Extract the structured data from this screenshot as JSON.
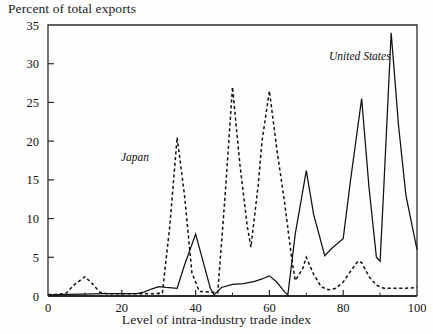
{
  "chart_data": {
    "type": "line",
    "title": "",
    "ylabel": "Percent of total exports",
    "xlabel": "Level of intra-industry trade index",
    "xlim": [
      0,
      100
    ],
    "ylim": [
      0,
      35
    ],
    "xticks": [
      0,
      20,
      40,
      60,
      80,
      100
    ],
    "xticks_minor": [
      10,
      30,
      50,
      70,
      90
    ],
    "yticks": [
      0,
      5,
      10,
      15,
      20,
      25,
      30,
      35
    ],
    "grid": false,
    "legend_position": "inline-annotations",
    "annotations": [
      {
        "text": "Japan",
        "x": 33,
        "y": 17.0,
        "style": "italic"
      },
      {
        "text": "United States",
        "x": 84,
        "y": 29.5,
        "style": "italic"
      }
    ],
    "series": [
      {
        "name": "Japan",
        "style": "dashed",
        "color": "#111111",
        "x": [
          0,
          3,
          5,
          7,
          10,
          12,
          14,
          16,
          20,
          24,
          27,
          29,
          31,
          33,
          35,
          37,
          39,
          41,
          44,
          46,
          48,
          50,
          52,
          54,
          55,
          57,
          58,
          60,
          62,
          64,
          66,
          67,
          69,
          70,
          72,
          74,
          76,
          78,
          80,
          82,
          84,
          85,
          87,
          89,
          91,
          93,
          95,
          97,
          100
        ],
        "y": [
          0.2,
          0.2,
          0.4,
          1.4,
          2.5,
          1.6,
          0.5,
          0.3,
          0.3,
          0.3,
          0.3,
          0.3,
          0.4,
          9.0,
          20.5,
          13.0,
          3.0,
          0.6,
          0.5,
          0.4,
          13.0,
          27.0,
          17.0,
          9.0,
          6.3,
          14.5,
          20.0,
          26.5,
          19.0,
          12.5,
          5.0,
          2.0,
          3.5,
          5.0,
          2.8,
          1.2,
          0.8,
          1.0,
          1.8,
          3.2,
          4.5,
          4.3,
          2.5,
          1.4,
          1.0,
          1.0,
          1.0,
          1.0,
          1.1
        ]
      },
      {
        "name": "United States",
        "style": "solid",
        "color": "#111111",
        "x": [
          0,
          5,
          10,
          15,
          20,
          24,
          26,
          28,
          30,
          32,
          35,
          37,
          40,
          42,
          44,
          45,
          47,
          50,
          53,
          56,
          58,
          60,
          62,
          64,
          65,
          67,
          70,
          72,
          75,
          77,
          80,
          82,
          85,
          87,
          89,
          90,
          91,
          93,
          95,
          97,
          100
        ],
        "y": [
          0.15,
          0.2,
          0.25,
          0.3,
          0.3,
          0.3,
          0.5,
          0.9,
          1.2,
          1.1,
          1.0,
          4.0,
          8.0,
          4.5,
          1.0,
          0.15,
          1.1,
          1.5,
          1.6,
          1.9,
          2.2,
          2.6,
          1.8,
          0.6,
          0.15,
          8.0,
          16.2,
          10.5,
          5.2,
          6.2,
          7.4,
          15.0,
          25.5,
          14.0,
          5.0,
          4.5,
          14.0,
          34.0,
          22.0,
          13.0,
          6.0
        ]
      }
    ]
  }
}
